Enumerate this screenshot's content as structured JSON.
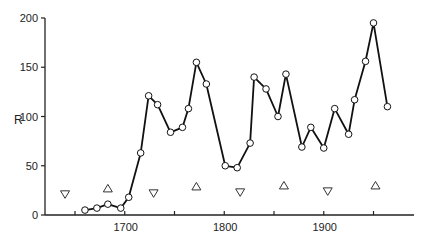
{
  "chart_data": {
    "type": "line",
    "title": "",
    "xlabel": "",
    "ylabel": "R",
    "xlim": [
      1620,
      1990
    ],
    "ylim": [
      0,
      200
    ],
    "grid": false,
    "legend": null,
    "x_ticks": [
      1650,
      1700,
      1750,
      1800,
      1850,
      1900,
      1950
    ],
    "x_tick_labels": [
      "",
      "1700",
      "",
      "1800",
      "",
      "1900",
      ""
    ],
    "y_ticks": [
      0,
      50,
      100,
      150,
      200
    ],
    "y_tick_labels": [
      "0",
      "50",
      "100",
      "150",
      "200"
    ],
    "series": [
      {
        "name": "R",
        "style": "line-with-open-circles",
        "x": [
          1660,
          1672,
          1683,
          1696,
          1704,
          1716,
          1724,
          1733,
          1746,
          1758,
          1764,
          1772,
          1782,
          1801,
          1813,
          1826,
          1830,
          1842,
          1854,
          1862,
          1878,
          1887,
          1900,
          1911,
          1925,
          1931,
          1942,
          1950,
          1964
        ],
        "values": [
          5,
          7,
          11,
          7,
          18,
          63,
          121,
          112,
          84,
          89,
          108,
          155,
          133,
          50,
          48,
          73,
          140,
          128,
          100,
          143,
          69,
          89,
          68,
          108,
          82,
          117,
          156,
          195,
          110
        ]
      }
    ],
    "annotations": [
      {
        "marker": "triangle-down",
        "x": 1640,
        "y": 21
      },
      {
        "marker": "triangle-up",
        "x": 1683,
        "y": 27
      },
      {
        "marker": "triangle-down",
        "x": 1729,
        "y": 22
      },
      {
        "marker": "triangle-up",
        "x": 1772,
        "y": 29
      },
      {
        "marker": "triangle-down",
        "x": 1816,
        "y": 23
      },
      {
        "marker": "triangle-up",
        "x": 1860,
        "y": 30
      },
      {
        "marker": "triangle-down",
        "x": 1904,
        "y": 24
      },
      {
        "marker": "triangle-up",
        "x": 1952,
        "y": 30
      }
    ]
  },
  "axes": {
    "y_label": "R",
    "y_ticks": [
      "0",
      "50",
      "100",
      "150",
      "200"
    ],
    "x_ticks": [
      "1700",
      "1800",
      "1900"
    ]
  }
}
